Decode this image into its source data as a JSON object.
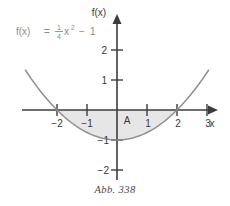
{
  "figure": {
    "caption": "Abb. 338",
    "function_label": {
      "lhs": "f(x)",
      "equals": "=",
      "numerator": "1",
      "denominator": "4",
      "variable": "x",
      "exponent": "2",
      "minus": "−",
      "constant": "1",
      "full": "f(x) = 1/4 x² − 1"
    },
    "area_label": "A",
    "axes": {
      "x_name": "x",
      "y_name": "f(x)",
      "x_ticks": [
        "−2",
        "−1",
        "1",
        "2",
        "3"
      ],
      "y_ticks": [
        "2",
        "1",
        "−1",
        "−2"
      ]
    },
    "colors": {
      "curve": "#8f8f8f",
      "axis": "#3c3c3c",
      "shade": "#e6e6e6",
      "text": "#3a3a3a",
      "label_gray": "#8c8c8c",
      "background": "#ffffff"
    }
  },
  "chart_data": {
    "type": "line",
    "title": "",
    "subtitle": "",
    "xlabel": "x",
    "ylabel": "f(x)",
    "xlim": [
      -3.2,
      3.3
    ],
    "ylim": [
      -2.4,
      2.7
    ],
    "grid": false,
    "legend": "none",
    "annotations": [
      {
        "text": "f(x) = 1/4 x² − 1",
        "x": -2.9,
        "y": 2.3
      },
      {
        "text": "A",
        "x": 0.35,
        "y": -0.35
      }
    ],
    "xticks": [
      -2,
      -1,
      1,
      2,
      3
    ],
    "xticklabels": [
      "−2",
      "−1",
      "1",
      "2",
      "3"
    ],
    "yticks": [
      2,
      1,
      -1,
      -2
    ],
    "yticklabels": [
      "2",
      "1",
      "−1",
      "−2"
    ],
    "series": [
      {
        "name": "f(x) = 1/4 x² − 1",
        "formula": "0.25*x^2 - 1",
        "x": [
          -3.05,
          -2.75,
          -2.5,
          -2.25,
          -2.0,
          -1.75,
          -1.5,
          -1.25,
          -1.0,
          -0.75,
          -0.5,
          -0.25,
          0.0,
          0.25,
          0.5,
          0.75,
          1.0,
          1.25,
          1.5,
          1.75,
          2.0,
          2.25,
          2.5,
          2.75,
          3.05
        ],
        "y": [
          1.326,
          0.891,
          0.563,
          0.266,
          0.0,
          -0.234,
          -0.438,
          -0.609,
          -0.75,
          -0.859,
          -0.938,
          -0.984,
          -1.0,
          -0.984,
          -0.938,
          -0.859,
          -0.75,
          -0.609,
          -0.438,
          -0.234,
          0.0,
          0.266,
          0.563,
          0.891,
          1.326
        ]
      }
    ],
    "shaded_region": {
      "label": "A",
      "x_from": -2,
      "x_to": 2,
      "upper": "y = 0",
      "lower": "f(x) = 1/4 x² − 1",
      "fill": "#e6e6e6"
    },
    "roots": [
      -2,
      2
    ],
    "vertex": [
      0,
      -1
    ]
  }
}
